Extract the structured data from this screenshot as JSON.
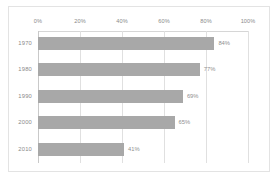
{
  "chart_data": {
    "type": "bar",
    "orientation": "horizontal",
    "title": "",
    "xlabel": "",
    "ylabel": "",
    "categories": [
      "1970",
      "1980",
      "1990",
      "2000",
      "2010"
    ],
    "values": [
      84,
      77,
      69,
      65,
      41
    ],
    "value_labels": [
      "84%",
      "77%",
      "69%",
      "65%",
      "41%"
    ],
    "xlim": [
      0,
      100
    ],
    "xticks": [
      0,
      20,
      40,
      60,
      80,
      100
    ],
    "xtick_labels": [
      "0%",
      "20%",
      "40%",
      "60%",
      "80%",
      "100%"
    ],
    "grid": true,
    "grid_axis": "x",
    "legend": false,
    "axis_position": "top",
    "bar_color": "#a8a8a8",
    "gridline_color": "#e0e0e0",
    "label_color": "#8a8a8a",
    "background_color": "#ffffff",
    "border_color": "#e3e3e3"
  }
}
